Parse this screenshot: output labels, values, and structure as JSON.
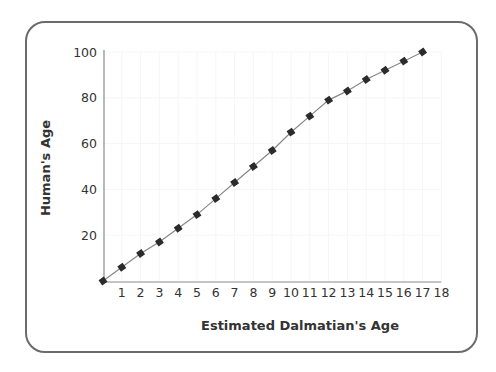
{
  "chart_data": {
    "type": "line",
    "title": "",
    "xlabel": "Estimated Dalmatian's Age",
    "ylabel": "Human's Age",
    "x": [
      0,
      1,
      2,
      3,
      4,
      5,
      6,
      7,
      8,
      9,
      10,
      11,
      12,
      13,
      14,
      15,
      16,
      17
    ],
    "series": [
      {
        "name": "Human's Age",
        "values": [
          0,
          6,
          12,
          17,
          23,
          29,
          36,
          43,
          50,
          57,
          65,
          72,
          79,
          83,
          88,
          92,
          96,
          100
        ]
      }
    ],
    "xticks": [
      "1",
      "2",
      "3",
      "4",
      "5",
      "6",
      "7",
      "8",
      "9",
      "10",
      "11",
      "12",
      "13",
      "14",
      "15",
      "16",
      "17",
      "18"
    ],
    "yticks": [
      "20",
      "40",
      "60",
      "80",
      "100"
    ],
    "xlim": [
      0,
      18
    ],
    "ylim": [
      0,
      100
    ],
    "grid": false,
    "legend": "none",
    "marker": "diamond",
    "colors": {
      "line": "#888888",
      "marker": "#2b2b2b",
      "axis": "#8a8a8a",
      "frame": "#6b6b6b",
      "text": "#333333"
    }
  }
}
